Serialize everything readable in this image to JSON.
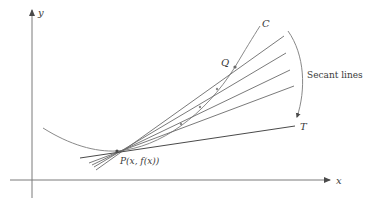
{
  "diagram": {
    "axes": {
      "x_label": "x",
      "y_label": "y"
    },
    "labels": {
      "curve": "C",
      "point_q": "Q",
      "point_p": "P(x, f(x))",
      "tangent": "T",
      "secants": "Secant lines"
    },
    "colors": {
      "stroke": "#6b6b6b",
      "curve": "#8a8a8a",
      "text": "#3a3a3a",
      "background": "#ffffff"
    }
  }
}
